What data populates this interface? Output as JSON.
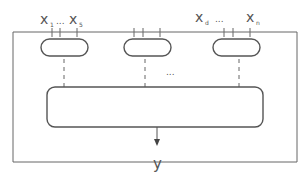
{
  "diagram": {
    "type": "block-diagram",
    "inputs_left": {
      "var": "x",
      "from_sub": "1",
      "ellipsis": "...",
      "to_sub": "5"
    },
    "inputs_right": {
      "var": "x",
      "from_sub": "d",
      "ellipsis": "...",
      "to_sub": "n"
    },
    "middle_ellipsis": "...",
    "output_label": "y",
    "sub_modules": 3,
    "colors": {
      "stroke": "#555555",
      "text": "#555555",
      "background": "#ffffff"
    }
  }
}
